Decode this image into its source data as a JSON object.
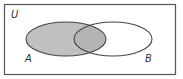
{
  "diagram": {
    "type": "venn",
    "universe": {
      "label": "U"
    },
    "sets": [
      {
        "id": "A",
        "label": "A",
        "shaded": true
      },
      {
        "id": "B",
        "label": "B",
        "shaded": false
      }
    ],
    "shaded_region": "A",
    "colors": {
      "background": "#ffffff",
      "border": "#555555",
      "shade": "#c0c0c0",
      "overlap_shade": "#b4b4b4",
      "outline": "#444444"
    }
  }
}
